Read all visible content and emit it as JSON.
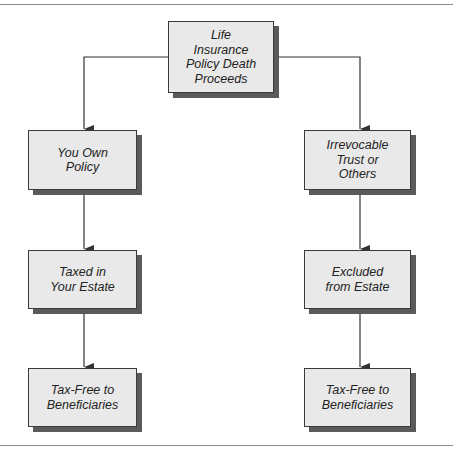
{
  "diagram": {
    "root": {
      "label": "Life\nInsurance\nPolicy Death\nProceeds"
    },
    "left_branch": [
      {
        "label": "You Own\nPolicy"
      },
      {
        "label": "Taxed in\nYour Estate"
      },
      {
        "label": "Tax-Free to\nBeneficiaries"
      }
    ],
    "right_branch": [
      {
        "label": "Irrevocable\nTrust or\nOthers"
      },
      {
        "label": "Excluded\nfrom Estate"
      },
      {
        "label": "Tax-Free to\nBeneficiaries"
      }
    ],
    "colors": {
      "box_fill": "#e9e9e9",
      "box_border": "#3a3a3a",
      "shadow": "#5a5a5a",
      "line": "#333333"
    }
  }
}
